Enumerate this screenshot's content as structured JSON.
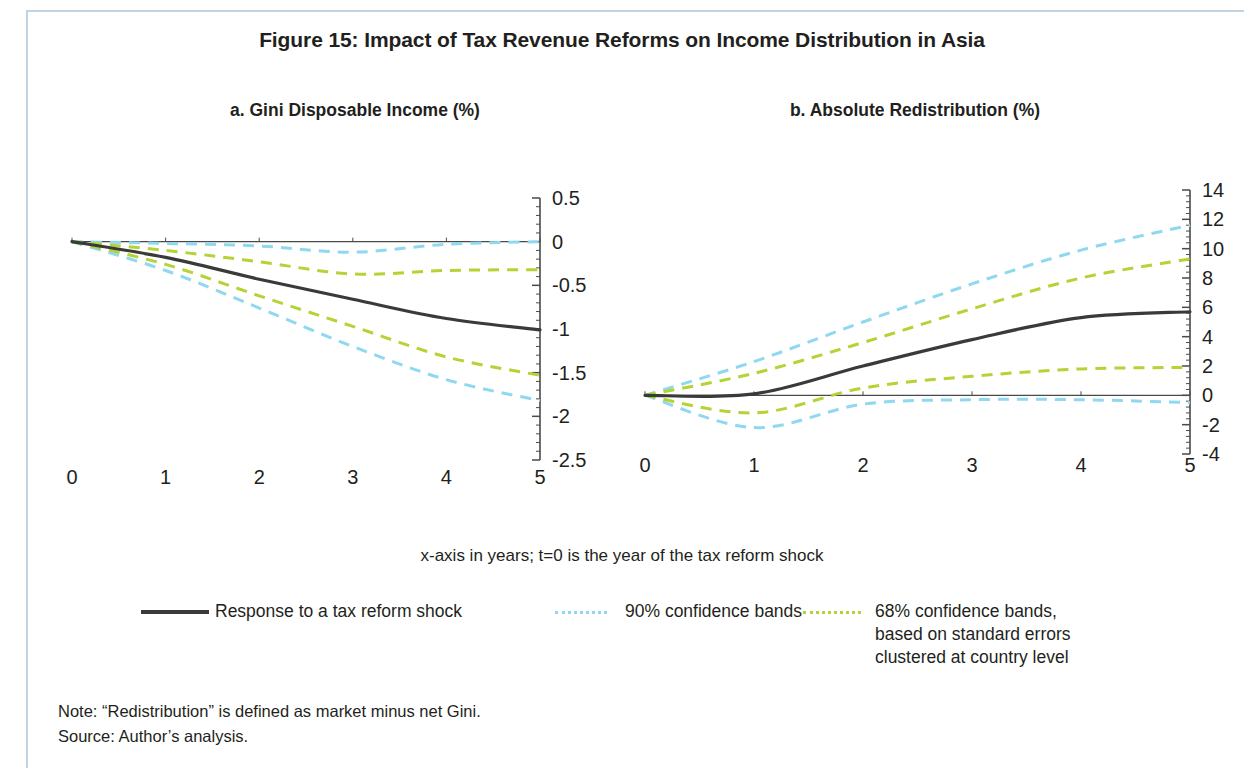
{
  "figure": {
    "title": "Figure 15: Impact of Tax Revenue Reforms on Income Distribution in Asia",
    "axis_note": "x-axis in years; t=0 is the year of the tax reform shock",
    "note": "Note: “Redistribution” is defined as market minus net Gini.",
    "source": "Source: Author’s analysis."
  },
  "legend": {
    "position": "bottom",
    "items": [
      {
        "label": "Response to a tax reform shock",
        "style": "solid",
        "color": "#3a3a3a",
        "swatch": "solid-line-swatch"
      },
      {
        "label": "90% confidence bands",
        "style": "dashed",
        "color": "#8fd8f0",
        "swatch": "dashed-cyan-swatch"
      },
      {
        "label": "68% confidence bands,\nbased on standard errors\nclustered at country level",
        "style": "dashed",
        "color": "#b5d334",
        "swatch": "dashed-green-swatch"
      }
    ]
  },
  "colors": {
    "response_line": "#3a3a3a",
    "band_90": "#8fd8f0",
    "band_68": "#b5d334",
    "axis": "#4a4a4a",
    "page_border": "#c3d4e0"
  },
  "chart_data": [
    {
      "id": "panel-a",
      "type": "line",
      "title": "a. Gini Disposable Income (%)",
      "xlabel": "",
      "ylabel": "",
      "x": [
        0,
        1,
        2,
        3,
        4,
        5
      ],
      "xlim": [
        0,
        5
      ],
      "ylim": [
        -2.5,
        0.5
      ],
      "xticks": [
        "0",
        "1",
        "2",
        "3",
        "4",
        "5"
      ],
      "yticks": [
        "0.5",
        "0",
        "-0.5",
        "-1",
        "-1.5",
        "-2",
        "-2.5"
      ],
      "ytick_values": [
        0.5,
        0,
        -0.5,
        -1,
        -1.5,
        -2,
        -2.5
      ],
      "grid": false,
      "zero_line": 0,
      "series": [
        {
          "name": "Response to a tax reform shock",
          "style": "solid",
          "color": "#3a3a3a",
          "values": [
            0,
            -0.18,
            -0.43,
            -0.66,
            -0.88,
            -1.01
          ]
        },
        {
          "name": "90% upper",
          "style": "dashed",
          "color": "#8fd8f0",
          "values": [
            0,
            -0.02,
            -0.05,
            -0.12,
            -0.03,
            0.0
          ]
        },
        {
          "name": "90% lower",
          "style": "dashed",
          "color": "#8fd8f0",
          "values": [
            0,
            -0.33,
            -0.76,
            -1.2,
            -1.58,
            -1.82
          ]
        },
        {
          "name": "68% upper",
          "style": "dashed",
          "color": "#b5d334",
          "values": [
            0,
            -0.1,
            -0.23,
            -0.37,
            -0.33,
            -0.32
          ]
        },
        {
          "name": "68% lower",
          "style": "dashed",
          "color": "#b5d334",
          "values": [
            0,
            -0.26,
            -0.62,
            -0.97,
            -1.32,
            -1.53
          ]
        }
      ]
    },
    {
      "id": "panel-b",
      "type": "line",
      "title": "b. Absolute Redistribution (%)",
      "xlabel": "",
      "ylabel": "",
      "x": [
        0,
        1,
        2,
        3,
        4,
        5
      ],
      "xlim": [
        0,
        5
      ],
      "ylim": [
        -4,
        14
      ],
      "xticks": [
        "0",
        "1",
        "2",
        "3",
        "4",
        "5"
      ],
      "yticks": [
        "14",
        "12",
        "10",
        "8",
        "6",
        "4",
        "2",
        "0",
        "-2",
        "-4"
      ],
      "ytick_values": [
        14,
        12,
        10,
        8,
        6,
        4,
        2,
        0,
        -2,
        -4
      ],
      "grid": false,
      "zero_line": 0,
      "series": [
        {
          "name": "Response to a tax reform shock",
          "style": "solid",
          "color": "#3a3a3a",
          "values": [
            0,
            0.1,
            2.0,
            3.8,
            5.3,
            5.7
          ]
        },
        {
          "name": "90% upper",
          "style": "dashed",
          "color": "#8fd8f0",
          "values": [
            0,
            2.3,
            5.0,
            7.6,
            9.9,
            11.6
          ]
        },
        {
          "name": "90% lower",
          "style": "dashed",
          "color": "#8fd8f0",
          "values": [
            0,
            -2.2,
            -0.6,
            -0.3,
            -0.3,
            -0.5
          ]
        },
        {
          "name": "68% upper",
          "style": "dashed",
          "color": "#b5d334",
          "values": [
            0,
            1.5,
            3.6,
            5.9,
            8.0,
            9.3
          ]
        },
        {
          "name": "68% lower",
          "style": "dashed",
          "color": "#b5d334",
          "values": [
            0,
            -1.2,
            0.5,
            1.3,
            1.8,
            1.9
          ]
        }
      ]
    }
  ]
}
